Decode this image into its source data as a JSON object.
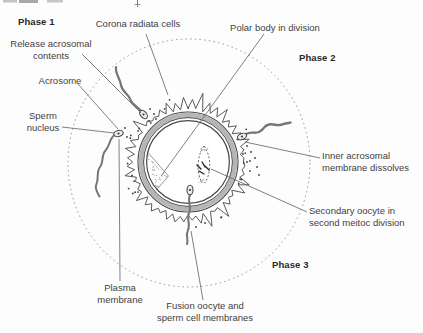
{
  "labels": {
    "phase1": "Phase 1",
    "phase2": "Phase 2",
    "phase3": "Phase 3",
    "corona_radiata": "Corona radiata cells",
    "polar_body": "Polar body in division",
    "release_acrosomal_1": "Release acrosomal",
    "release_acrosomal_2": "contents",
    "acrosome": "Acrosome",
    "sperm_nucleus_1": "Sperm",
    "sperm_nucleus_2": "nucleus",
    "inner_acrosomal_1": "Inner acrosomal",
    "inner_acrosomal_2": "membrane dissolves",
    "secondary_oocyte_1": "Secondary oocyte in",
    "secondary_oocyte_2": "second meitoc division",
    "plasma_membrane_1": "Plasma",
    "plasma_membrane_2": "membrane",
    "fusion_1": "Fusion oocyte and",
    "fusion_2": "sperm cell membranes"
  },
  "colors": {
    "background": "#fdfdfd",
    "text": "#3f3f3f",
    "phase_text": "#2a2a2a",
    "outline": "#484848",
    "leader_line": "#616161",
    "dashed_circle": "#8d8d8d",
    "zona_pellucida_fill": "#b5b5b5",
    "sperm_tail": "#757575",
    "sperm_head_fill": "#ececec",
    "stipple": "#8a8a8a",
    "edge_artifact": "#a8a8a8"
  }
}
